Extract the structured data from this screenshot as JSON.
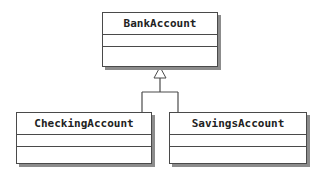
{
  "diagram": {
    "type": "uml-class-diagram",
    "classes": [
      {
        "id": "bank-account",
        "name": "BankAccount",
        "attributes": [],
        "operations": []
      },
      {
        "id": "checking-account",
        "name": "CheckingAccount",
        "attributes": [],
        "operations": []
      },
      {
        "id": "savings-account",
        "name": "SavingsAccount",
        "attributes": [],
        "operations": []
      }
    ],
    "relationships": [
      {
        "type": "generalization",
        "from": "CheckingAccount",
        "to": "BankAccount"
      },
      {
        "type": "generalization",
        "from": "SavingsAccount",
        "to": "BankAccount"
      }
    ],
    "colors": {
      "line": "#4a4a4a",
      "shadow": "#8c8c8c",
      "fill": "#ffffff"
    }
  }
}
